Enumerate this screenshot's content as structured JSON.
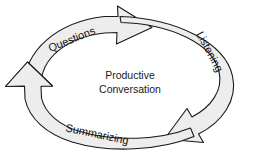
{
  "diagram": {
    "type": "cycle-diagram",
    "title_center": {
      "line1": "Productive",
      "line2": "Conversation"
    },
    "background_color": "#ffffff",
    "band_fill_color": "#ededed",
    "band_stroke_color": "#1a1a1a",
    "text_color": "#1a1a1a",
    "segments": [
      {
        "id": "questions",
        "label": "Questions",
        "position": "upper-left",
        "rotation_deg": -22,
        "label_x": 72,
        "label_y": 40,
        "arrow_points_to": "listening"
      },
      {
        "id": "listening",
        "label": "Listening",
        "position": "right",
        "rotation_deg": 62,
        "label_x": 209,
        "label_y": 52,
        "arrow_points_to": "summarizing"
      },
      {
        "id": "summarizing",
        "label": "Summarizing",
        "position": "bottom",
        "rotation_deg": 12,
        "label_x": 97,
        "label_y": 135,
        "arrow_points_to": "questions"
      }
    ],
    "arrowheads": [
      {
        "id": "arrowhead-top",
        "x": 135,
        "y": 14,
        "direction": "right-up"
      },
      {
        "id": "arrowhead-left",
        "x": 27,
        "y": 74,
        "direction": "up-right"
      },
      {
        "id": "arrowhead-bottom-right",
        "x": 196,
        "y": 127,
        "direction": "down-left"
      }
    ]
  }
}
